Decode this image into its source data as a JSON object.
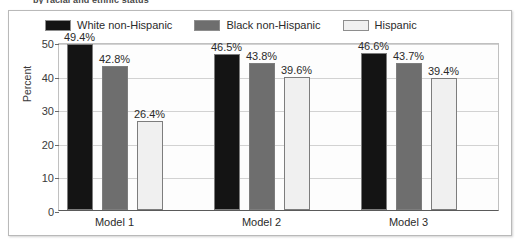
{
  "caption_sliver": "by racial and ethnic status",
  "chart_data": {
    "type": "bar",
    "title": "",
    "xlabel": "",
    "ylabel": "Percent",
    "ylim": [
      0,
      50
    ],
    "yticks": [
      0,
      10,
      20,
      30,
      40,
      50
    ],
    "grid": true,
    "legend_position": "top-left",
    "categories": [
      "Model 1",
      "Model 2",
      "Model 3"
    ],
    "series": [
      {
        "name": "White non-Hispanic",
        "color": "#141414",
        "values": [
          49.4,
          46.5,
          46.6
        ],
        "labels": [
          "49.4%",
          "46.5%",
          "46.6%"
        ]
      },
      {
        "name": "Black non-Hispanic",
        "color": "#6e6e6e",
        "values": [
          42.8,
          43.8,
          43.7
        ],
        "labels": [
          "42.8%",
          "43.8%",
          "43.7%"
        ]
      },
      {
        "name": "Hispanic",
        "color": "#f0f0f0",
        "values": [
          26.4,
          39.6,
          39.4
        ],
        "labels": [
          "26.4%",
          "39.6%",
          "39.4%"
        ]
      }
    ]
  }
}
